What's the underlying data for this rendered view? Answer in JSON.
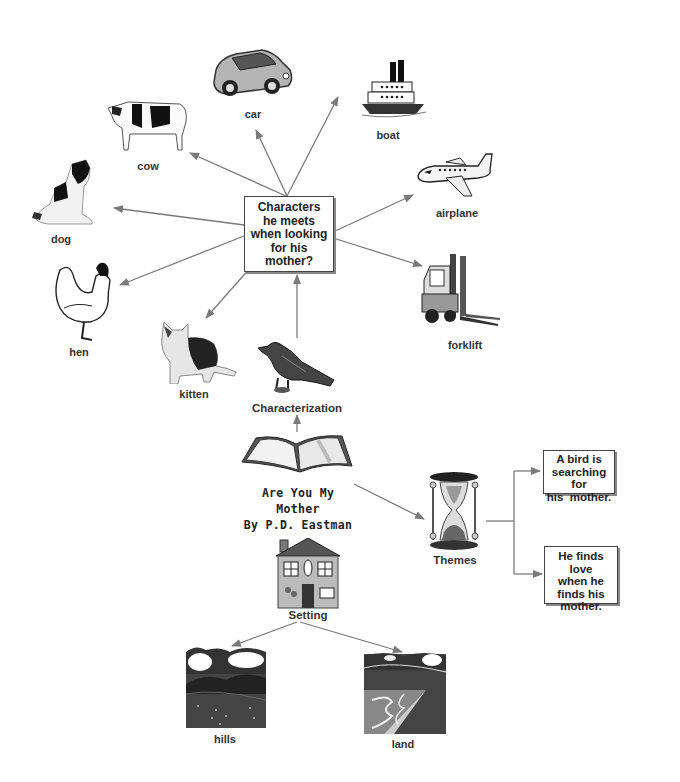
{
  "diagram": {
    "type": "concept-map",
    "center_book": {
      "title_lines": [
        "Are You My",
        "Mother",
        "By P.D. Eastman"
      ],
      "icon": "open-book-icon"
    },
    "characterization": {
      "label": "Characterization",
      "icon": "bird-icon",
      "question_box": {
        "lines": [
          "Characters",
          "he meets",
          "when looking",
          "for his",
          "mother?"
        ]
      },
      "characters": [
        {
          "label": "car",
          "icon": "car-icon"
        },
        {
          "label": "boat",
          "icon": "boat-icon"
        },
        {
          "label": "airplane",
          "icon": "airplane-icon"
        },
        {
          "label": "forklift",
          "icon": "forklift-icon"
        },
        {
          "label": "cow",
          "icon": "cow-icon"
        },
        {
          "label": "dog",
          "icon": "dog-icon"
        },
        {
          "label": "hen",
          "icon": "hen-icon"
        },
        {
          "label": "kitten",
          "icon": "kitten-icon"
        }
      ]
    },
    "themes": {
      "label": "Themes",
      "icon": "hourglass-icon",
      "items": [
        {
          "lines": [
            "A bird is",
            "searching for",
            "his  mother."
          ]
        },
        {
          "lines": [
            "He finds love",
            "when he",
            "finds his",
            "mother."
          ]
        }
      ]
    },
    "setting": {
      "label": "Setting",
      "icon": "house-icon",
      "items": [
        {
          "label": "hills",
          "icon": "hills-landscape-icon"
        },
        {
          "label": "land",
          "icon": "river-landscape-icon"
        }
      ]
    },
    "colors": {
      "arrow": "#7a7a7a",
      "box_border": "#444444",
      "text": "#222222"
    }
  }
}
